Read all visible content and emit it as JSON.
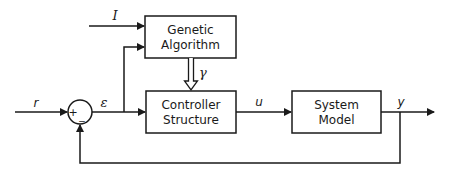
{
  "diagram": {
    "type": "block-diagram",
    "colors": {
      "stroke": "#1a1a1a",
      "background": "#ffffff"
    },
    "blocks": [
      {
        "id": "ga",
        "line1": "Genetic",
        "line2": "Algorithm"
      },
      {
        "id": "controller",
        "line1": "Controller",
        "line2": "Structure"
      },
      {
        "id": "plant",
        "line1": "System",
        "line2": "Model"
      }
    ],
    "summing_junction": {
      "plus": "+",
      "minus": "_"
    },
    "signals": {
      "reference": "r",
      "error": "ε",
      "ga_input": "I",
      "parameters": "γ",
      "control": "u",
      "output": "y"
    },
    "edges": [
      {
        "from": "r",
        "to": "sum"
      },
      {
        "from": "sum",
        "to": "controller",
        "label": "ε"
      },
      {
        "from": "I",
        "to": "ga"
      },
      {
        "from": "ε-branch",
        "to": "ga"
      },
      {
        "from": "ga",
        "to": "controller",
        "label": "γ",
        "style": "hollow-arrow"
      },
      {
        "from": "controller",
        "to": "plant",
        "label": "u"
      },
      {
        "from": "plant",
        "to": "output",
        "label": "y"
      },
      {
        "from": "y-branch",
        "to": "sum",
        "sign": "-"
      }
    ]
  }
}
